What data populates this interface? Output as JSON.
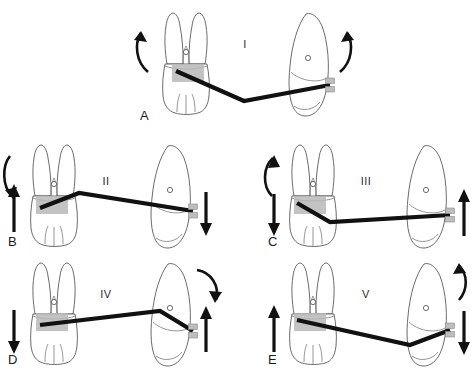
{
  "figure": {
    "width": 474,
    "height": 381,
    "background_color": "#ffffff",
    "line_color": "#111111",
    "tooth_outline_color": "#5a5a5a",
    "band_color": "#b8b8b8"
  },
  "panels": [
    {
      "id": "panel-a",
      "letter": "A",
      "numeral": "I",
      "numeral_x": 245,
      "numeral_y": 48,
      "letter_x": 140,
      "letter_y": 120,
      "description": "Centered V-bend between molar and anterior tooth",
      "molar_moment": "counterclockwise-crown-distal",
      "anterior_moment": "clockwise-crown-mesial",
      "molar_force": "none",
      "anterior_force": "none",
      "wire_shape": "centered-v-bend-down"
    },
    {
      "id": "panel-b",
      "letter": "B",
      "numeral": "II",
      "numeral_x": 103,
      "numeral_y": 185,
      "letter_x": 10,
      "letter_y": 246,
      "description": "V-bend off-center toward molar",
      "molar_moment": "clockwise-downward-curved",
      "anterior_moment": "none",
      "molar_force": "up",
      "anterior_force": "down",
      "wire_shape": "v-bend-near-molar-up"
    },
    {
      "id": "panel-c",
      "letter": "C",
      "numeral": "III",
      "numeral_x": 362,
      "numeral_y": 185,
      "letter_x": 272,
      "letter_y": 246,
      "description": "V-bend adjacent to molar with reversed forces",
      "molar_moment": "counterclockwise-upward-curved",
      "anterior_moment": "none",
      "molar_force": "down",
      "anterior_force": "up",
      "wire_shape": "bend-at-molar-down"
    },
    {
      "id": "panel-d",
      "letter": "D",
      "numeral": "IV",
      "numeral_x": 103,
      "numeral_y": 298,
      "letter_x": 10,
      "letter_y": 364,
      "description": "V-bend off-center toward anterior tooth",
      "molar_moment": "none",
      "anterior_moment": "clockwise-downward-curved",
      "molar_force": "down",
      "anterior_force": "up",
      "wire_shape": "v-bend-near-anterior-up"
    },
    {
      "id": "panel-e",
      "letter": "E",
      "numeral": "V",
      "numeral_x": 362,
      "numeral_y": 298,
      "letter_x": 272,
      "letter_y": 364,
      "description": "V-bend near anterior tooth with reversed forces",
      "molar_moment": "none",
      "anterior_moment": "counterclockwise-upward-curved",
      "molar_force": "up",
      "anterior_force": "down",
      "wire_shape": "v-bend-near-anterior-down"
    }
  ],
  "elements": {
    "molar_label": "molar tooth buccal view with two roots",
    "anterior_label": "anterior tooth proximal view",
    "band_label": "molar band attachment",
    "bracket_label": "anterior bracket attachment",
    "wire_label": "archwire",
    "force_arrow_label": "vertical force arrow",
    "moment_arrow_label": "moment curved arrow"
  }
}
